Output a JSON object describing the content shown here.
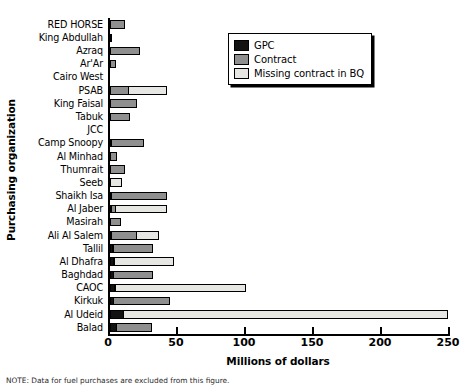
{
  "chart_data": {
    "type": "bar",
    "orientation": "horizontal",
    "stacked": true,
    "title": "",
    "xlabel": "Millions of dollars",
    "ylabel": "Purchasing organization",
    "xlim": [
      0,
      250
    ],
    "xticks": [
      0,
      50,
      100,
      150,
      200,
      250
    ],
    "xtick_labels": [
      "0",
      "50",
      "100",
      "150",
      "200",
      "250"
    ],
    "grid": false,
    "legend_position": "upper right",
    "categories": [
      "RED HORSE",
      "King Abdullah",
      "Azraq",
      "Ar'Ar",
      "Cairo West",
      "PSAB",
      "King Faisal",
      "Tabuk",
      "JCC",
      "Camp Snoopy",
      "Al Minhad",
      "Thumrait",
      "Seeb",
      "Shaikh Isa",
      "Al Jaber",
      "Masirah",
      "Ali Al Salem",
      "Tallil",
      "Al Dhafra",
      "Baghdad",
      "CAOC",
      "Kirkuk",
      "Al Udeid",
      "Balad"
    ],
    "series": [
      {
        "name": "GPC",
        "color": "#121212",
        "values": [
          0,
          0,
          0,
          0,
          0,
          0,
          0,
          0,
          0,
          0.5,
          0,
          0,
          0,
          0.8,
          0.8,
          0,
          1.5,
          2.5,
          3.0,
          3.0,
          3.5,
          3.0,
          10.0,
          5.0
        ]
      },
      {
        "name": "Contract",
        "color": "#8f8f8f",
        "values": [
          11.0,
          1.5,
          22.0,
          4.5,
          0,
          14.0,
          20.0,
          14.5,
          0,
          24.5,
          5.5,
          11.0,
          0,
          41.0,
          3.5,
          8.0,
          19.0,
          30.0,
          1.5,
          29.5,
          0.5,
          42.0,
          0,
          26.5
        ]
      },
      {
        "name": "Missing contract in BQ",
        "color": "#e6e6e3",
        "values": [
          0,
          0,
          0,
          0,
          0,
          28.5,
          0,
          0,
          0,
          0,
          0,
          0,
          8.5,
          0,
          38.5,
          0,
          17.0,
          0,
          44.0,
          0,
          96.5,
          0,
          239.0,
          0
        ]
      }
    ],
    "legend_entries": [
      "GPC",
      "Contract",
      "Missing contract in BQ"
    ]
  },
  "footnote": "NOTE: Data for fuel purchases are excluded from this figure."
}
